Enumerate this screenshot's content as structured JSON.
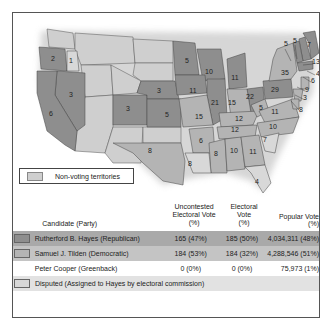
{
  "legend": {
    "non_voting_label": "Non-voting territories",
    "non_voting_color": "#cfcfcf"
  },
  "colors": {
    "republican": "#8e8e8e",
    "democratic": "#b4b4b4",
    "disputed": "#d8d8d8",
    "territory": "#cfcfcf"
  },
  "map_labels": [
    {
      "state": "OR",
      "value": "2",
      "x": 40,
      "y": 48
    },
    {
      "state": "ID?",
      "value": "1",
      "x": 58,
      "y": 50
    },
    {
      "state": "NV",
      "value": "3",
      "x": 58,
      "y": 84
    },
    {
      "state": "CA",
      "value": "6",
      "x": 38,
      "y": 103
    },
    {
      "state": "CO",
      "value": "3",
      "x": 115,
      "y": 98
    },
    {
      "state": "NE",
      "value": "3",
      "x": 146,
      "y": 80
    },
    {
      "state": "KS",
      "value": "5",
      "x": 154,
      "y": 104
    },
    {
      "state": "MN",
      "value": "5",
      "x": 174,
      "y": 50
    },
    {
      "state": "WI",
      "value": "10",
      "x": 196,
      "y": 61
    },
    {
      "state": "IA",
      "value": "11",
      "x": 180,
      "y": 80
    },
    {
      "state": "IL",
      "value": "21",
      "x": 202,
      "y": 92
    },
    {
      "state": "MI",
      "value": "11",
      "x": 222,
      "y": 67
    },
    {
      "state": "IN",
      "value": "15",
      "x": 219,
      "y": 92
    },
    {
      "state": "OH",
      "value": "22",
      "x": 237,
      "y": 86
    },
    {
      "state": "PA",
      "value": "29",
      "x": 262,
      "y": 79
    },
    {
      "state": "NY",
      "value": "35",
      "x": 272,
      "y": 62
    },
    {
      "state": "MO",
      "value": "15",
      "x": 186,
      "y": 106
    },
    {
      "state": "KY",
      "value": "12",
      "x": 226,
      "y": 108
    },
    {
      "state": "WV",
      "value": "5",
      "x": 248,
      "y": 97
    },
    {
      "state": "VA",
      "value": "11",
      "x": 262,
      "y": 101
    },
    {
      "state": "TN",
      "value": "12",
      "x": 222,
      "y": 119
    },
    {
      "state": "NC",
      "value": "10",
      "x": 260,
      "y": 116
    },
    {
      "state": "AR",
      "value": "6",
      "x": 188,
      "y": 130
    },
    {
      "state": "SC",
      "value": "7",
      "x": 252,
      "y": 129
    },
    {
      "state": "MS",
      "value": "8",
      "x": 203,
      "y": 143
    },
    {
      "state": "AL",
      "value": "10",
      "x": 221,
      "y": 140
    },
    {
      "state": "GA",
      "value": "11",
      "x": 240,
      "y": 141
    },
    {
      "state": "TX",
      "value": "8",
      "x": 137,
      "y": 140
    },
    {
      "state": "LA",
      "value": "8",
      "x": 177,
      "y": 153
    },
    {
      "state": "FL",
      "value": "4",
      "x": 244,
      "y": 171
    },
    {
      "state": "VT",
      "value": "5",
      "x": 273,
      "y": 33
    },
    {
      "state": "NH",
      "value": "5",
      "x": 282,
      "y": 30
    },
    {
      "state": "ME",
      "value": "7",
      "x": 296,
      "y": 34
    },
    {
      "state": "MA",
      "value": "13",
      "x": 303,
      "y": 51
    },
    {
      "state": "RI",
      "value": "4",
      "x": 305,
      "y": 63
    },
    {
      "state": "CT",
      "value": "6",
      "x": 300,
      "y": 70
    },
    {
      "state": "NJ",
      "value": "9",
      "x": 294,
      "y": 79
    },
    {
      "state": "DE",
      "value": "3",
      "x": 292,
      "y": 87
    },
    {
      "state": "MD",
      "value": "8",
      "x": 288,
      "y": 99
    }
  ],
  "table": {
    "headers": {
      "candidate": "Candidate (Party)",
      "uncontested": [
        "Uncontested",
        "Electoral Vote",
        "(%)"
      ],
      "electoral": [
        "Electoral",
        "Vote",
        "(%)"
      ],
      "popular": "Popular Vote (%)"
    },
    "rows": [
      {
        "candidate": "Rutherford B. Hayes (Republican)",
        "uncontested": "165 (47%)",
        "electoral": "185 (50%)",
        "popular": "4,034,311 (48%)",
        "swatch": "#8e8e8e"
      },
      {
        "candidate": "Samuel J. Tilden (Democratic)",
        "uncontested": "184 (53%)",
        "electoral": "184 (32%)",
        "popular": "4,288,546 (51%)",
        "swatch": "#b4b4b4"
      },
      {
        "candidate": "Peter Cooper (Greenback)",
        "uncontested": "0 (0%)",
        "electoral": "0 (0%)",
        "popular": "75,973 (1%)"
      }
    ],
    "disputed_label": "Disputed (Assigned to Hayes by electoral commission)"
  }
}
